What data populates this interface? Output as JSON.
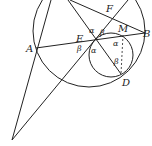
{
  "diagram": {
    "points": {
      "A": "A",
      "B": "B",
      "D": "D",
      "E": "E",
      "F": "F",
      "M": "M"
    },
    "angles": {
      "alpha": "α",
      "beta": "β"
    },
    "colors": {
      "stroke": "#222222",
      "background": "#ffffff"
    }
  }
}
